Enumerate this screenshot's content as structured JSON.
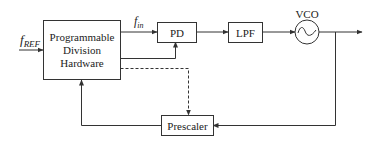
{
  "diagram": {
    "blocks": {
      "division": {
        "line1": "Programmable",
        "line2": "Division",
        "line3": "Hardware"
      },
      "pd": {
        "label": "PD"
      },
      "lpf": {
        "label": "LPF"
      },
      "vco": {
        "label": "VCO",
        "symbol": "~"
      },
      "prescaler": {
        "label": "Prescaler"
      }
    },
    "signals": {
      "fref": {
        "main": "f",
        "sub": "REF"
      },
      "fin": {
        "main": "f",
        "sub": "in"
      }
    },
    "connections": [
      {
        "from": "fref-input",
        "to": "division",
        "style": "solid"
      },
      {
        "from": "division",
        "to": "pd",
        "label": "f_in",
        "style": "solid"
      },
      {
        "from": "division",
        "to": "pd-bottom",
        "style": "solid"
      },
      {
        "from": "division",
        "to": "prescaler",
        "style": "dashed"
      },
      {
        "from": "pd",
        "to": "lpf",
        "style": "solid"
      },
      {
        "from": "lpf",
        "to": "vco",
        "style": "solid"
      },
      {
        "from": "vco",
        "to": "output",
        "style": "solid"
      },
      {
        "from": "vco",
        "to": "prescaler",
        "style": "solid"
      },
      {
        "from": "prescaler",
        "to": "division",
        "style": "solid"
      }
    ],
    "colors": {
      "line": "#333333",
      "text": "#222222",
      "background": "#ffffff"
    }
  }
}
